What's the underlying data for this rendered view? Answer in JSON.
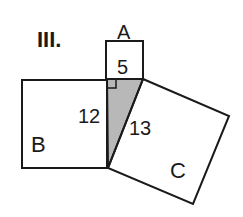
{
  "title": "III.",
  "squares": {
    "A": {
      "label": "A",
      "side_label": "5"
    },
    "B": {
      "label": "B",
      "side_label": "12"
    },
    "C": {
      "label": "C",
      "side_label": "13"
    }
  },
  "triangle": {
    "fill": "#b8b8b8",
    "right_angle_marker": true
  },
  "colors": {
    "stroke": "#1a1a1a",
    "background": "#ffffff",
    "shade": "#b8b8b8"
  }
}
